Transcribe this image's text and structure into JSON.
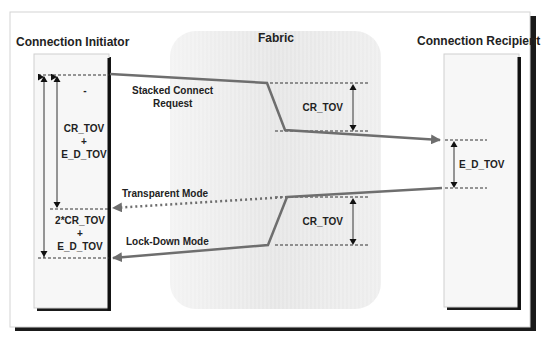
{
  "diagram": {
    "participants": {
      "initiator": {
        "label": "Connection  Initiator"
      },
      "fabric": {
        "label": "Fabric"
      },
      "recipient": {
        "label": "Connection Recipient"
      }
    },
    "messages": {
      "stacked_connect_line1": "Stacked Connect",
      "stacked_connect_line2": "Request",
      "transparent_mode": "Transparent Mode",
      "lockdown_mode": "Lock-Down Mode"
    },
    "timers": {
      "initiator_top": {
        "dash": "-",
        "line1": "CR_TOV",
        "plus": "+",
        "line2": "E_D_TOV"
      },
      "initiator_bottom": {
        "line1": "2*CR_TOV",
        "plus": "+",
        "line2": "E_D_TOV"
      },
      "fabric_top": "CR_TOV",
      "fabric_bottom": "CR_TOV",
      "recipient": "E_D_TOV"
    },
    "colors": {
      "frame": "#1a1a1a",
      "message_line": "#6e6e6e",
      "fabric_fill": "#ececec",
      "box_fill": "#f6f6f6",
      "text": "#222222"
    }
  }
}
